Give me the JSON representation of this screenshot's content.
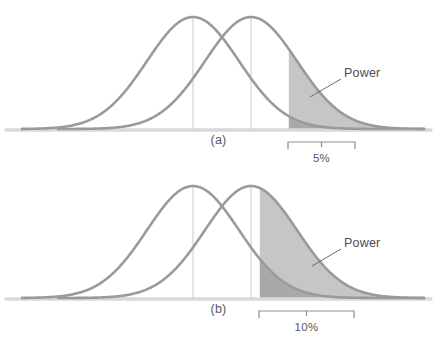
{
  "figure": {
    "colors": {
      "curve_stroke": "#9a9a9c",
      "baseline": "#d9d9d9",
      "mean_line": "#c9c9c9",
      "power_fill": "#c6c6c6",
      "alpha_fill": "#9e9e9e",
      "text": "#59585a",
      "leader_line": "#6a6a6c",
      "bracket": "#8d8d8f",
      "background": "#ffffff"
    },
    "geometry": {
      "width": 437,
      "height": 338,
      "panel_height": 169,
      "baseline_y": 129,
      "peak_y": 17,
      "null_mean_x": 193,
      "alt_mean_x": 251,
      "curve_left_x": 22,
      "curve_right_x": 424,
      "sigma_px": 46
    }
  },
  "chart_data": {
    "type": "area",
    "xlabel": "",
    "ylabel": "",
    "grid": false,
    "legend_position": "inline-annotation",
    "series": [
      {
        "name": "Null distribution H0",
        "distribution": "normal",
        "mean_px": 193,
        "sigma_px": 46,
        "peak_y_px": 17,
        "role": "null-hypothesis-curve"
      },
      {
        "name": "Alternative distribution H1",
        "distribution": "normal",
        "mean_px": 251,
        "sigma_px": 46,
        "peak_y_px": 17,
        "role": "alternative-hypothesis-curve"
      }
    ],
    "panels": [
      {
        "id": "a",
        "caption": "(a)",
        "significance_level": "5%",
        "alpha": 0.05,
        "critical_x_px": 288,
        "bracket_from_px": 288,
        "bracket_to_px": 355,
        "power_label": "Power",
        "power_label_x_px": 344,
        "power_label_y_px": 66,
        "leader_from_px": [
          341,
          79
        ],
        "leader_to_px": [
          310,
          97
        ],
        "shaded_regions": [
          {
            "name": "power-region",
            "fill": "#c6c6c6",
            "under": "Alternative distribution H1",
            "from_px": 288
          },
          {
            "name": "alpha-region",
            "fill": "#9e9e9e",
            "under": "Null distribution H0",
            "from_px": 288
          }
        ]
      },
      {
        "id": "b",
        "caption": "(b)",
        "significance_level": "10%",
        "alpha": 0.1,
        "critical_x_px": 259,
        "bracket_from_px": 259,
        "bracket_to_px": 354,
        "power_label": "Power",
        "power_label_x_px": 344,
        "power_label_y_px": 236,
        "leader_from_px": [
          341,
          249
        ],
        "leader_to_px": [
          312,
          266
        ],
        "shaded_regions": [
          {
            "name": "power-region",
            "fill": "#c6c6c6",
            "under": "Alternative distribution H1",
            "from_px": 259
          },
          {
            "name": "alpha-region",
            "fill": "#9e9e9e",
            "under": "Null distribution H0",
            "from_px": 259
          }
        ]
      }
    ]
  },
  "panels": {
    "a": {
      "caption": "(a)",
      "percent_label": "5%",
      "power_label": "Power"
    },
    "b": {
      "caption": "(b)",
      "percent_label": "10%",
      "power_label": "Power"
    }
  }
}
